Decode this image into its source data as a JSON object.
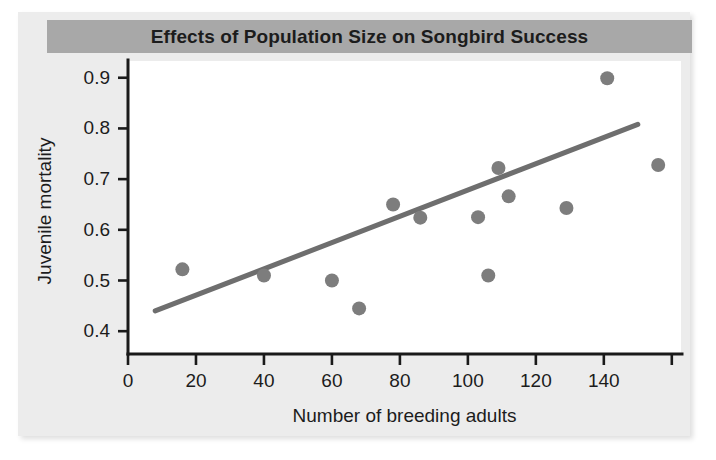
{
  "figure": {
    "title": "Effects of Population Size on Songbird Success",
    "title_banner_color": "#a8a8a8",
    "paper_color": "#ececec",
    "plot_background": "#ffffff"
  },
  "chart_data": {
    "type": "scatter",
    "title": "Effects of Population Size on Songbird Success",
    "xlabel": "Number of breeding adults",
    "ylabel": "Juvenile mortality",
    "xlim": [
      0,
      163
    ],
    "ylim": [
      0.355,
      0.935
    ],
    "grid": false,
    "legend": null,
    "xticks": [
      0,
      20,
      40,
      60,
      80,
      100,
      120,
      140,
      160
    ],
    "xtick_labels": [
      "0",
      "20",
      "40",
      "60",
      "80",
      "100",
      "120",
      "140",
      ""
    ],
    "yticks": [
      0.4,
      0.5,
      0.6,
      0.7,
      0.8,
      0.9
    ],
    "ytick_labels": [
      "0.4",
      "0.5",
      "0.6",
      "0.7",
      "0.8",
      "0.9"
    ],
    "point_color": "#7d7d7d",
    "point_radius": 7,
    "points": [
      {
        "x": 16,
        "y": 0.522
      },
      {
        "x": 40,
        "y": 0.51
      },
      {
        "x": 60,
        "y": 0.5
      },
      {
        "x": 68,
        "y": 0.445
      },
      {
        "x": 78,
        "y": 0.65
      },
      {
        "x": 86,
        "y": 0.624
      },
      {
        "x": 103,
        "y": 0.625
      },
      {
        "x": 106,
        "y": 0.51
      },
      {
        "x": 109,
        "y": 0.722
      },
      {
        "x": 112,
        "y": 0.666
      },
      {
        "x": 129,
        "y": 0.643
      },
      {
        "x": 141,
        "y": 0.899
      },
      {
        "x": 156,
        "y": 0.728
      }
    ],
    "trend_line": {
      "color": "#6e6e6e",
      "width": 5,
      "x_start": 8,
      "y_start": 0.44,
      "x_end": 150,
      "y_end": 0.808
    }
  }
}
